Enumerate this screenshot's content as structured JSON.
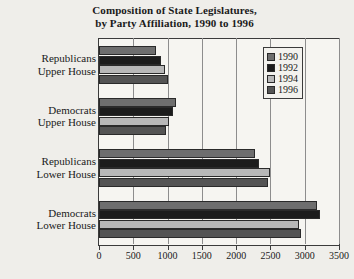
{
  "chart_data": {
    "type": "bar",
    "orientation": "horizontal",
    "title": "Composition of State Legislatures,\nby Party Affiliation, 1990 to 1996",
    "title_line1": "Composition of State Legislatures,",
    "title_line2": "by Party Affiliation, 1990 to 1996",
    "xlabel": "",
    "ylabel": "",
    "xlim": [
      0,
      3500
    ],
    "xticks": [
      0,
      500,
      1000,
      1500,
      2000,
      2500,
      3000,
      3500
    ],
    "xtick_labels": [
      "0",
      "500",
      "1000",
      "1500",
      "2000",
      "2500",
      "3000",
      "3500"
    ],
    "grid": true,
    "legend_position": "top-right",
    "categories": [
      "Republicans Upper House",
      "Democrats Upper House",
      "Republicans Lower House",
      "Democrats Lower House"
    ],
    "category_lines": [
      [
        "Republicans",
        "Upper House"
      ],
      [
        "Democrats",
        "Upper House"
      ],
      [
        "Republicans",
        "Lower House"
      ],
      [
        "Democrats",
        "Lower House"
      ]
    ],
    "series": [
      {
        "name": "1990",
        "color": "#6e6e6e",
        "values": [
          830,
          1130,
          2280,
          3180
        ]
      },
      {
        "name": "1992",
        "color": "#1c1c1c",
        "values": [
          900,
          1080,
          2330,
          3230
        ]
      },
      {
        "name": "1994",
        "color": "#b8b8b8",
        "values": [
          960,
          1020,
          2500,
          2910
        ]
      },
      {
        "name": "1996",
        "color": "#545454",
        "values": [
          1010,
          970,
          2470,
          2950
        ]
      }
    ]
  },
  "legend": {
    "items": [
      {
        "label": "1990",
        "color": "#6e6e6e"
      },
      {
        "label": "1992",
        "color": "#1c1c1c"
      },
      {
        "label": "1994",
        "color": "#b8b8b8"
      },
      {
        "label": "1996",
        "color": "#545454"
      }
    ]
  }
}
